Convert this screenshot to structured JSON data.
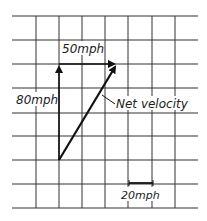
{
  "diagram": {
    "grid": {
      "x_lines": [
        36,
        59,
        82,
        105,
        128,
        152,
        175
      ],
      "y_lines": [
        16,
        40,
        64,
        88,
        113,
        136,
        160,
        184,
        208
      ],
      "x_start": 12,
      "x_end": 198,
      "y_start": 16,
      "y_end": 208,
      "color": "#333333"
    },
    "vectors": [
      {
        "name": "north-velocity",
        "label": "80mph",
        "from": [
          59,
          160
        ],
        "to": [
          59,
          64
        ]
      },
      {
        "name": "east-velocity",
        "label": "50mph",
        "from": [
          59,
          64
        ],
        "to": [
          117,
          64
        ]
      },
      {
        "name": "net-velocity",
        "label": "Net velocity",
        "from": [
          59,
          160
        ],
        "to": [
          117,
          64
        ]
      }
    ],
    "labels": {
      "north": "80mph",
      "east": "50mph",
      "net": "Net velocity",
      "scale": "20mph"
    },
    "scale_bar": {
      "from": [
        129,
        183
      ],
      "to": [
        153,
        183
      ],
      "label": "20mph"
    }
  }
}
